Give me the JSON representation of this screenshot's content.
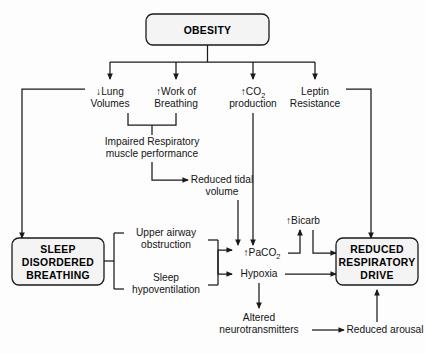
{
  "diagram": {
    "background_color": "#fdfdfd",
    "line_color": "#1a1a1a",
    "box_fill": "#f4f4f4"
  },
  "nodes": {
    "obesity": {
      "label": "OBESITY",
      "type": "rounded-box"
    },
    "lung_volumes": {
      "line1": "↓Lung",
      "line2": "Volumes",
      "type": "text"
    },
    "work_breathing": {
      "line1": "↑Work of",
      "line2": "Breathing",
      "type": "text"
    },
    "co2_production": {
      "prefix": "↑CO",
      "sub": "2",
      "line2": "production",
      "type": "text"
    },
    "leptin_resistance": {
      "line1": "Leptin",
      "line2": "Resistance",
      "type": "text"
    },
    "impaired_muscle": {
      "line1": "Impaired Respiratory",
      "line2": "muscle performance",
      "type": "text"
    },
    "reduced_tidal": {
      "line1": "Reduced tidal",
      "line2": "volume",
      "type": "text"
    },
    "sleep_disordered": {
      "line1": "SLEEP",
      "line2": "DISORDERED",
      "line3": "BREATHING",
      "type": "rounded-box"
    },
    "upper_airway": {
      "line1": "Upper airway",
      "line2": "obstruction",
      "type": "text"
    },
    "sleep_hypoventilation": {
      "line1": "Sleep",
      "line2": "hypoventilation",
      "type": "text"
    },
    "paco2": {
      "prefix": "↑PaCO",
      "sub": "2",
      "type": "text"
    },
    "hypoxia": {
      "label": "Hypoxia",
      "type": "text"
    },
    "bicarb": {
      "label": "↑Bicarb",
      "type": "text"
    },
    "reduced_drive": {
      "line1": "REDUCED",
      "line2": "RESPIRATORY",
      "line3": "DRIVE",
      "type": "rounded-box"
    },
    "altered_neuro": {
      "line1": "Altered",
      "line2": "neurotransmitters",
      "type": "text"
    },
    "reduced_arousal": {
      "label": "Reduced arousal",
      "type": "text"
    }
  },
  "edges": [
    {
      "from": "obesity",
      "to": "lung_volumes",
      "arrow": true
    },
    {
      "from": "obesity",
      "to": "work_breathing",
      "arrow": true
    },
    {
      "from": "obesity",
      "to": "co2_production",
      "arrow": true
    },
    {
      "from": "obesity",
      "to": "leptin_resistance",
      "arrow": true
    },
    {
      "from": "lung_volumes",
      "to": "sleep_disordered",
      "arrow": true
    },
    {
      "from": "lung_volumes",
      "to": "impaired_muscle",
      "arrow": false
    },
    {
      "from": "work_breathing",
      "to": "impaired_muscle",
      "arrow": false
    },
    {
      "from": "impaired_muscle",
      "to": "reduced_tidal",
      "arrow": true
    },
    {
      "from": "reduced_tidal",
      "to": "paco2",
      "arrow": true
    },
    {
      "from": "co2_production",
      "to": "paco2",
      "arrow": true
    },
    {
      "from": "leptin_resistance",
      "to": "reduced_drive",
      "arrow": true
    },
    {
      "from": "sleep_disordered",
      "to": "upper_airway",
      "arrow": false
    },
    {
      "from": "sleep_disordered",
      "to": "sleep_hypoventilation",
      "arrow": false
    },
    {
      "from": "upper_airway",
      "to": "paco2",
      "arrow": true
    },
    {
      "from": "sleep_hypoventilation",
      "to": "hypoxia",
      "arrow": true
    },
    {
      "from": "paco2",
      "to": "bicarb",
      "arrow": true
    },
    {
      "from": "bicarb",
      "to": "reduced_drive",
      "arrow": true
    },
    {
      "from": "hypoxia",
      "to": "reduced_drive",
      "arrow": true
    },
    {
      "from": "hypoxia",
      "to": "altered_neuro",
      "arrow": true
    },
    {
      "from": "altered_neuro",
      "to": "reduced_arousal",
      "arrow": true
    },
    {
      "from": "reduced_arousal",
      "to": "reduced_drive",
      "arrow": true
    }
  ]
}
